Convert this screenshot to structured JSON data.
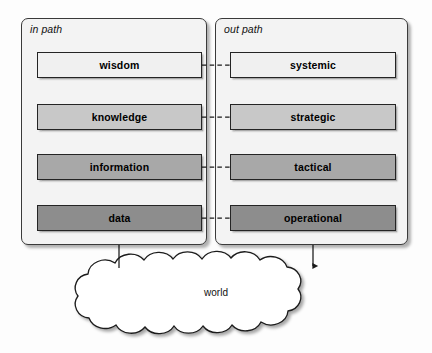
{
  "diagram": {
    "canvas": {
      "width": 432,
      "height": 353
    },
    "background_color": "#fdfdfd"
  },
  "panels": [
    {
      "id": "in-path",
      "label": "in path",
      "fill": "#f3f3f3",
      "border_color": "#3a3a3a",
      "flow_direction": "upward",
      "x": 21,
      "y": 18,
      "w": 186,
      "h": 227
    },
    {
      "id": "out-path",
      "label": "out path",
      "fill": "#f3f3f3",
      "border_color": "#3a3a3a",
      "flow_direction": "downward",
      "x": 215,
      "y": 18,
      "w": 193,
      "h": 227
    }
  ],
  "stages": {
    "in_path": [
      {
        "label": "wisdom",
        "fill": "#f0f0f0",
        "x": 37,
        "y": 52,
        "w": 165,
        "h": 26
      },
      {
        "label": "knowledge",
        "fill": "#c8c8c8",
        "x": 37,
        "y": 104,
        "w": 165,
        "h": 26
      },
      {
        "label": "information",
        "fill": "#a8a8a8",
        "x": 37,
        "y": 154,
        "w": 165,
        "h": 26
      },
      {
        "label": "data",
        "fill": "#8d8d8d",
        "x": 37,
        "y": 205,
        "w": 165,
        "h": 26
      }
    ],
    "out_path": [
      {
        "label": "systemic",
        "fill": "#f0f0f0",
        "x": 230,
        "y": 52,
        "w": 166,
        "h": 26
      },
      {
        "label": "strategic",
        "fill": "#c8c8c8",
        "x": 230,
        "y": 104,
        "w": 166,
        "h": 26
      },
      {
        "label": "tactical",
        "fill": "#a8a8a8",
        "x": 230,
        "y": 154,
        "w": 166,
        "h": 26
      },
      {
        "label": "operational",
        "fill": "#8d8d8d",
        "x": 230,
        "y": 205,
        "w": 166,
        "h": 26
      }
    ]
  },
  "cloud": {
    "label": "world",
    "fill": "#ffffff",
    "border_color": "#1a1a1a",
    "center_x": 218,
    "center_y": 297
  },
  "connectors": {
    "cross_links": [
      {
        "from": "wisdom",
        "to": "systemic",
        "style": "dashed",
        "y": 65
      },
      {
        "from": "knowledge",
        "to": "strategic",
        "style": "dashed",
        "y": 117
      },
      {
        "from": "information",
        "to": "tactical",
        "style": "dashed",
        "y": 167
      },
      {
        "from": "data",
        "to": "operational",
        "style": "dashed",
        "y": 218
      }
    ],
    "in_path_arrows": [
      {
        "from": "world",
        "to": "data",
        "direction": "up"
      },
      {
        "from": "data",
        "to": "information",
        "direction": "up"
      },
      {
        "from": "information",
        "to": "knowledge",
        "direction": "up"
      },
      {
        "from": "knowledge",
        "to": "wisdom",
        "direction": "up"
      }
    ],
    "out_path_arrows": [
      {
        "from": "systemic",
        "to": "strategic",
        "direction": "down"
      },
      {
        "from": "strategic",
        "to": "tactical",
        "direction": "down"
      },
      {
        "from": "tactical",
        "to": "operational",
        "direction": "down"
      },
      {
        "from": "operational",
        "to": "world",
        "direction": "down"
      }
    ],
    "line_color": "#1a1a1a"
  }
}
